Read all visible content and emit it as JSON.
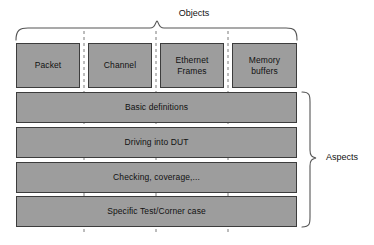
{
  "diagram": {
    "title_top": "Objects",
    "title_right": "Aspects",
    "colors": {
      "box_fill": "#9d9d9d",
      "box_border": "#3c3c3c",
      "background": "#ffffff",
      "text": "#111111",
      "brace_stroke": "#555555",
      "dashed_stroke": "#777777"
    },
    "objects": [
      {
        "label": "Packet",
        "x": 16,
        "width": 64
      },
      {
        "label": "Channel",
        "x": 88,
        "width": 64
      },
      {
        "label": "Ethernet\nFrames",
        "line1": "Ethernet",
        "line2": "Frames",
        "x": 160,
        "width": 64
      },
      {
        "label": "Memory buffers",
        "line1": "Memory",
        "line2": "buffers",
        "x": 232,
        "width": 65
      }
    ],
    "aspects": [
      {
        "label": "Basic definitions",
        "y": 92
      },
      {
        "label": "Driving into DUT",
        "y": 127
      },
      {
        "label": "Checking, coverage,...",
        "y": 162
      },
      {
        "label": "Specific Test/Corner case",
        "y": 196
      }
    ],
    "dividers": [
      {
        "x": 84
      },
      {
        "x": 156
      },
      {
        "x": 228
      }
    ]
  }
}
